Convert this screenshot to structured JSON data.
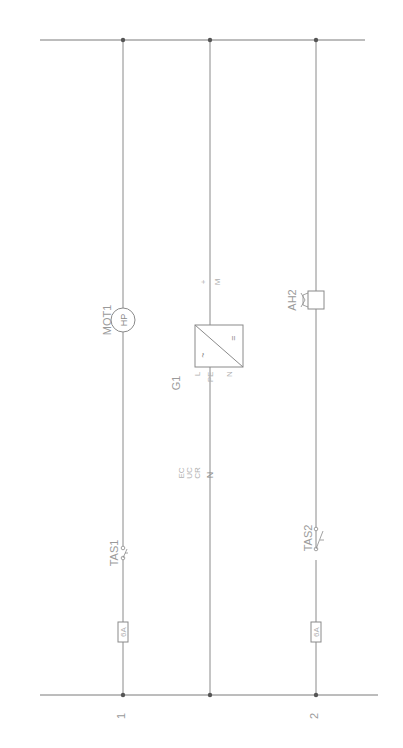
{
  "diagram": {
    "type": "electrical-schematic",
    "orientation": "rotated-90",
    "colors": {
      "wire": "#8a8a8a",
      "rail": "#7a7a7a",
      "junction": "#555555",
      "label": "#9a9a9a"
    },
    "rails": [
      {
        "id": "top-rail"
      },
      {
        "id": "bottom-rail"
      }
    ],
    "branches": [
      {
        "id": "branch-1",
        "number": "1",
        "components": [
          {
            "ref": "MOT1",
            "type": "motor",
            "symbol_text": "HP"
          },
          {
            "ref": "TAS1",
            "type": "switch"
          },
          {
            "ref": "",
            "type": "fuse",
            "symbol_text": "6A"
          }
        ]
      },
      {
        "id": "branch-mid",
        "number": "",
        "components": [
          {
            "ref": "G1",
            "type": "power-supply",
            "symbol_text_top": "=",
            "symbol_text_bottom": "~",
            "pins_out": [
              "+",
              "M"
            ],
            "pins_in": [
              "L",
              "PE",
              "N"
            ]
          },
          {
            "ref": "",
            "type": "terminal-block",
            "labels": [
              "EC",
              "UC",
              "CR"
            ],
            "pin": "N"
          }
        ]
      },
      {
        "id": "branch-2",
        "number": "2",
        "components": [
          {
            "ref": "AH2",
            "type": "horn"
          },
          {
            "ref": "TAS2",
            "type": "switch"
          },
          {
            "ref": "",
            "type": "fuse",
            "symbol_text": "6A"
          }
        ]
      }
    ]
  }
}
